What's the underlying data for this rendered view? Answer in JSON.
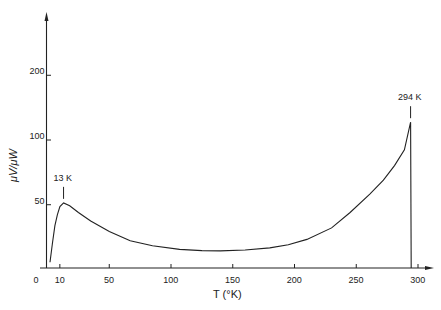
{
  "chart_data": {
    "type": "line",
    "title": "",
    "xlabel": "T (°K)",
    "ylabel": "μV/μW",
    "xlim": [
      0,
      305
    ],
    "ylim": [
      25,
      280
    ],
    "yscale": "log",
    "grid": false,
    "legend": null,
    "x_ticks": [
      {
        "value": 0,
        "label": "0"
      },
      {
        "value": 10,
        "label": "10"
      },
      {
        "value": 50,
        "label": "50"
      },
      {
        "value": 100,
        "label": "100"
      },
      {
        "value": 150,
        "label": "150"
      },
      {
        "value": 200,
        "label": "200"
      },
      {
        "value": 250,
        "label": "250"
      },
      {
        "value": 300,
        "label": "300"
      }
    ],
    "y_ticks": [
      {
        "value": 50,
        "label": "50"
      },
      {
        "value": 100,
        "label": "100"
      },
      {
        "value": 200,
        "label": "200"
      }
    ],
    "series": [
      {
        "name": "responsivity",
        "x": [
          2,
          4,
          6,
          8,
          10,
          13,
          18,
          25,
          35,
          50,
          67,
          85,
          107,
          125,
          140,
          160,
          180,
          195,
          210,
          230,
          245,
          261,
          272,
          281,
          289,
          294,
          294.5
        ],
        "y": [
          27,
          33,
          40,
          45,
          49,
          51,
          49.5,
          46,
          42,
          37.5,
          34,
          32.2,
          31,
          30.6,
          30.5,
          30.8,
          31.5,
          32.6,
          34.5,
          39,
          46,
          56,
          65,
          76,
          90,
          121,
          25
        ],
        "color": "#222222"
      }
    ],
    "annotations": [
      {
        "label": "13 K",
        "x": 13,
        "y": 51
      },
      {
        "label": "294 K",
        "x": 294,
        "y": 121
      }
    ]
  }
}
